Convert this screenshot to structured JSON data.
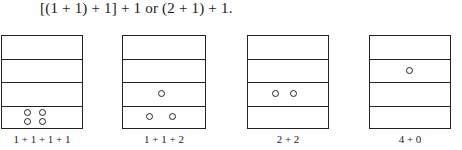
{
  "equation": "[(1 + 1) + 1] + 1 or (2 + 1) + 1.",
  "figures": [
    {
      "caption": "1 + 1 + 1 + 1",
      "beads": [
        [
          0,
          "row4"
        ],
        [
          1,
          "row4"
        ],
        [
          2,
          "row4"
        ],
        [
          3,
          "row4"
        ]
      ]
    },
    {
      "caption": "1 + 1 + 2",
      "beads": [
        [
          0,
          "row3"
        ],
        [
          1,
          "row4"
        ],
        [
          2,
          "row4"
        ]
      ]
    },
    {
      "caption": "2 + 2",
      "beads": [
        [
          0,
          "row3"
        ],
        [
          1,
          "row3"
        ]
      ]
    },
    {
      "caption": "4 + 0",
      "beads": [
        [
          0,
          "row2"
        ]
      ]
    }
  ]
}
